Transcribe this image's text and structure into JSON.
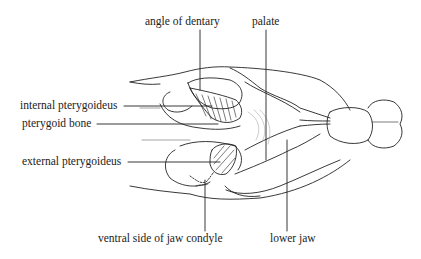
{
  "diagram": {
    "labels": [
      {
        "id": "angle-of-dentary",
        "text": "angle of dentary"
      },
      {
        "id": "palate",
        "text": "palate"
      },
      {
        "id": "internal-pterygoideus",
        "text": "internal pterygoideus"
      },
      {
        "id": "pterygoid-bone",
        "text": "pterygoid bone"
      },
      {
        "id": "external-pterygoideus",
        "text": "external pterygoideus"
      },
      {
        "id": "ventral-side-of-jaw-condyle",
        "text": "ventral side of jaw condyle"
      },
      {
        "id": "lower-jaw",
        "text": "lower jaw"
      }
    ],
    "colors": {
      "ink": "#222222",
      "background": "#ffffff"
    }
  }
}
